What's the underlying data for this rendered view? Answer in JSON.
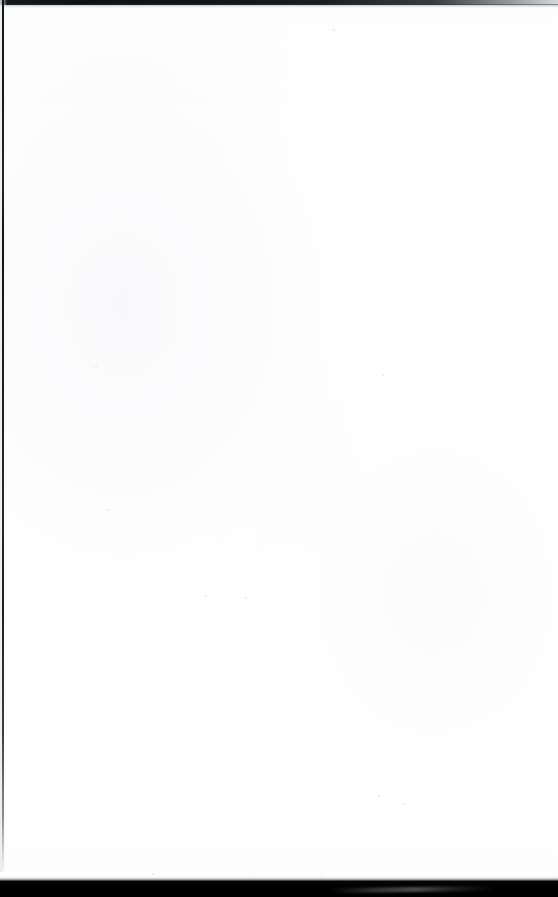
{
  "document": {
    "kind": "scanned-page",
    "content_text": "",
    "page_width": 558,
    "page_height": 897,
    "background_color": "#fefefe",
    "description": "Blank scanned document page — no printed text, headings, figures or marks are visible."
  },
  "artifacts": {
    "top_edge": {
      "name": "top-edge-shadow",
      "color": "#141517",
      "fade_to_color": "#d6d7d9",
      "height_px": 5
    },
    "left_edge": {
      "name": "left-margin-rule",
      "color": "#17181b",
      "width_px": 2,
      "height_px": 872
    },
    "bottom_edge": {
      "name": "bottom-scanner-band",
      "color": "#000000",
      "height_px": 16,
      "streak_color": "#96979a"
    }
  },
  "speckles": [
    {
      "x": 95,
      "y": 366,
      "size": 2
    },
    {
      "x": 382,
      "y": 374,
      "size": 2
    },
    {
      "x": 107,
      "y": 509,
      "size": 2
    },
    {
      "x": 205,
      "y": 595,
      "size": 2
    },
    {
      "x": 245,
      "y": 597,
      "size": 2
    },
    {
      "x": 378,
      "y": 795,
      "size": 2
    },
    {
      "x": 403,
      "y": 803,
      "size": 2
    },
    {
      "x": 333,
      "y": 29,
      "size": 2
    },
    {
      "x": 152,
      "y": 873,
      "size": 2
    },
    {
      "x": 321,
      "y": 876,
      "size": 2
    }
  ]
}
